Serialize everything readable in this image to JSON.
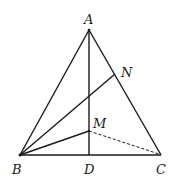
{
  "diagram": {
    "type": "geometry-figure",
    "points": {
      "A": {
        "label": "A",
        "x": 89,
        "y": 30
      },
      "B": {
        "label": "B",
        "x": 20,
        "y": 155
      },
      "C": {
        "label": "C",
        "x": 161,
        "y": 155
      },
      "D": {
        "label": "D",
        "x": 89,
        "y": 155
      },
      "M": {
        "label": "M",
        "x": 89,
        "y": 131
      },
      "N": {
        "label": "N",
        "x": 115,
        "y": 74
      }
    },
    "segments": [
      {
        "from": "A",
        "to": "B",
        "style": "solid"
      },
      {
        "from": "A",
        "to": "C",
        "style": "solid"
      },
      {
        "from": "B",
        "to": "C",
        "style": "solid"
      },
      {
        "from": "A",
        "to": "D",
        "style": "solid"
      },
      {
        "from": "B",
        "to": "N",
        "style": "solid"
      },
      {
        "from": "B",
        "to": "M",
        "style": "solid"
      },
      {
        "from": "M",
        "to": "C",
        "style": "dashed"
      }
    ]
  }
}
